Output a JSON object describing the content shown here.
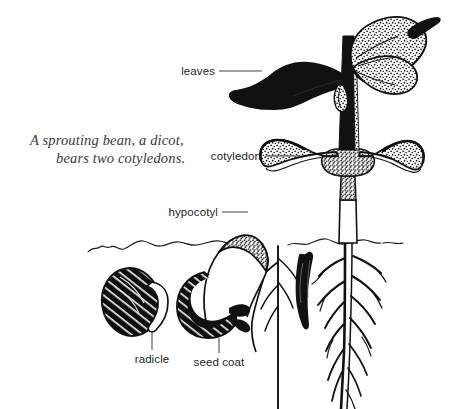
{
  "figure": {
    "kind": "botanical-illustration",
    "background_color": "#ffffff",
    "ink_color": "#111111",
    "caption_color": "#3b3a38",
    "label_color": "#231f20",
    "leader_color": "#4a4745"
  },
  "caption": {
    "line1": "A sprouting bean, a dicot,",
    "line2": "bears two cotyledons."
  },
  "labels": {
    "leaves": "leaves",
    "cotyledon": "cotyledon",
    "hypocotyl": "hypocotyl",
    "radicle": "radicle",
    "seed_coat": "seed coat"
  },
  "parts": [
    {
      "id": "leaves",
      "label": "leaves",
      "description": "pair of broad leaves at top of stem, one solid black, one stippled"
    },
    {
      "id": "cotyledon",
      "label": "cotyledon",
      "description": "two thick seed leaves curving upward around the stem"
    },
    {
      "id": "hypocotyl",
      "label": "hypocotyl",
      "description": "arched stem hook pushing up through the soil"
    },
    {
      "id": "radicle",
      "label": "radicle",
      "description": "first root emerging from the dormant bean"
    },
    {
      "id": "seed_coat",
      "label": "seed coat",
      "description": "dark outer coat splitting off the germinating bean"
    }
  ],
  "stages": [
    {
      "order": 1,
      "name": "bean with emerging radicle"
    },
    {
      "order": 2,
      "name": "bean with arching hypocotyl and shedding seed coat"
    },
    {
      "order": 3,
      "name": "young shoot emerging at soil surface"
    },
    {
      "order": 4,
      "name": "established seedling with cotyledons and leaves"
    }
  ],
  "soil": {
    "present": true,
    "description": "irregular hand-drawn ground line across the middle of the figure"
  }
}
